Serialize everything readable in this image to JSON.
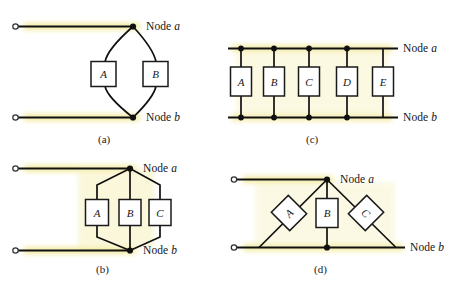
{
  "figure": {
    "background_color": "#ffffff",
    "wire_color": "#101010",
    "highlight_color": "#f5f0b8",
    "box_fill": "#ffffff",
    "box_stroke": "#1a1a1a",
    "node_dot_color": "#101010",
    "terminal_ring_color": "#3a3a3a",
    "node_a_label": "Node",
    "node_a_italic": "a",
    "node_b_label": "Node",
    "node_b_italic": "b"
  },
  "panels": [
    {
      "id": "a",
      "caption": "(a)",
      "topology": "two-parallel-arcs",
      "components": [
        "A",
        "B"
      ],
      "node_labels": {
        "top": "Node a",
        "bottom": "Node b"
      },
      "terminals": 2
    },
    {
      "id": "b",
      "caption": "(b)",
      "topology": "three-parallel-hex",
      "components": [
        "A",
        "B",
        "C"
      ],
      "node_labels": {
        "top": "Node a",
        "bottom": "Node b"
      },
      "terminals": 2
    },
    {
      "id": "c",
      "caption": "(c)",
      "topology": "five-parallel-ladder",
      "components": [
        "A",
        "B",
        "C",
        "D",
        "E"
      ],
      "node_labels": {
        "top": "Node a",
        "bottom": "Node b"
      },
      "terminals": 2
    },
    {
      "id": "d",
      "caption": "(d)",
      "topology": "three-parallel-triangle",
      "components": [
        "A",
        "B",
        "C"
      ],
      "node_labels": {
        "top": "Node a",
        "bottom": "Node b"
      },
      "terminals": 2
    }
  ],
  "labels": {
    "a_node_a": "Node",
    "a_node_a_it": "a",
    "a_node_b": "Node",
    "a_node_b_it": "b",
    "b_node_a": "Node",
    "b_node_a_it": "a",
    "b_node_b": "Node",
    "b_node_b_it": "b",
    "c_node_a": "Node",
    "c_node_a_it": "a",
    "c_node_b": "Node",
    "c_node_b_it": "b",
    "d_node_a": "Node",
    "d_node_a_it": "a",
    "d_node_b": "Node",
    "d_node_b_it": "b",
    "cap_a": "(a)",
    "cap_b": "(b)",
    "cap_c": "(c)",
    "cap_d": "(d)"
  },
  "boxes": {
    "a1": "A",
    "a2": "B",
    "b1": "A",
    "b2": "B",
    "b3": "C",
    "c1": "A",
    "c2": "B",
    "c3": "C",
    "c4": "D",
    "c5": "E",
    "d1": "A",
    "d2": "B",
    "d3": "C"
  }
}
